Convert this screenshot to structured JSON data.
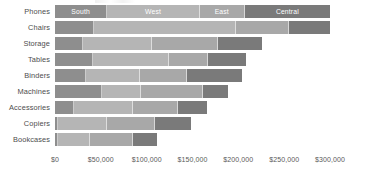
{
  "chart_data": {
    "type": "bar",
    "subtype": "horizontal-stacked",
    "title": "",
    "xlabel": "",
    "ylabel": "",
    "orientation": "horizontal",
    "stacked": true,
    "grid": false,
    "legend": "in-bar-labels-on-first-row",
    "xlim": [
      0,
      310000
    ],
    "xticks": [
      0,
      50000,
      100000,
      150000,
      200000,
      250000,
      300000
    ],
    "xticklabels": [
      "$0",
      "$50,000",
      "$100,000",
      "$150,000",
      "$200,000",
      "$250,000",
      "$300,000"
    ],
    "categories": [
      "Phones",
      "Chairs",
      "Storage",
      "Tables",
      "Binders",
      "Machines",
      "Accessories",
      "Copiers",
      "Bookcases"
    ],
    "series": [
      {
        "name": "South",
        "color": "#8e8e8e",
        "values": [
          57000,
          42000,
          31000,
          41000,
          34000,
          51000,
          21000,
          3000,
          3000
        ]
      },
      {
        "name": "West",
        "color": "#b5b5b5",
        "values": [
          101000,
          155000,
          75000,
          83000,
          59000,
          43000,
          64000,
          54000,
          35000
        ]
      },
      {
        "name": "East",
        "color": "#a8a8a8",
        "values": [
          49000,
          58000,
          72000,
          43000,
          51000,
          68000,
          49000,
          52000,
          47000
        ]
      },
      {
        "name": "Central",
        "color": "#7a7a7a",
        "values": [
          93000,
          45000,
          48000,
          41000,
          60000,
          27000,
          32000,
          39000,
          26000
        ]
      }
    ],
    "totals": [
      300000,
      300000,
      226000,
      208000,
      204000,
      189000,
      166000,
      148000,
      111000
    ],
    "segment_labels_row": "Phones",
    "segment_labels": [
      "South",
      "West",
      "East",
      "Central"
    ]
  },
  "axis": {
    "tick_color": "#5a5a5a",
    "category_label_color": "#4d4d4d"
  }
}
